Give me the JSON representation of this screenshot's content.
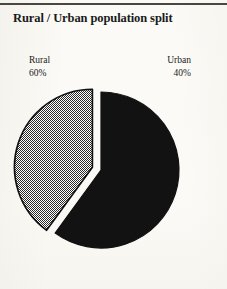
{
  "chart_data": {
    "type": "pie",
    "title": "Rural / Urban population split",
    "xlabel": "",
    "ylabel": "",
    "exploded": true,
    "legend_position": "above-slices",
    "grid": false,
    "categories": [
      "Rural",
      "Urban"
    ],
    "values": [
      60,
      40
    ],
    "units": "percent",
    "slices": [
      {
        "name": "Rural",
        "label": "Rural",
        "value": 60,
        "value_label": "60%",
        "fill": "#121212",
        "pattern": "solid",
        "exploded": false
      },
      {
        "name": "Urban",
        "label": "Urban",
        "value": 40,
        "value_label": "40%",
        "fill": "#9a9a9a",
        "pattern": "checker-dither",
        "exploded": true
      }
    ],
    "annotations": [
      {
        "text": "Rural",
        "position": "top-left"
      },
      {
        "text": "60%",
        "position": "top-left"
      },
      {
        "text": "Urban",
        "position": "top-right"
      },
      {
        "text": "40%",
        "position": "top-right"
      }
    ]
  },
  "colors": {
    "background": "#fbfaf6",
    "ink": "#1a1a1a",
    "rule": "#4a4740",
    "slice_rural": "#121212",
    "slice_urban": "#9a9a9a",
    "slice_outline": "#111111"
  },
  "labels": {
    "rural_name": "Rural",
    "rural_pct": "60%",
    "urban_name": "Urban",
    "urban_pct": "40%"
  }
}
